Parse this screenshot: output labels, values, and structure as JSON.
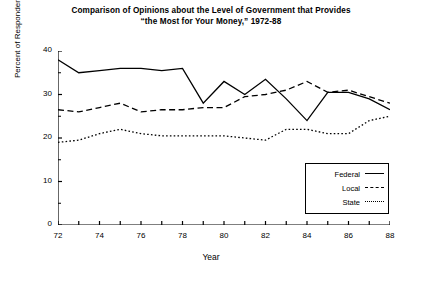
{
  "chart_data": {
    "type": "line",
    "title": "Comparison of Opinions about the Level of Government that Provides “the Most for Your Money,” 1972-88",
    "title_line1": "Comparison of Opinions about the Level of Government that Provides",
    "title_line2": "“the Most for Your Money,” 1972-88",
    "xlabel": "Year",
    "ylabel": "Percent of Respondents",
    "xlim": [
      72,
      88
    ],
    "ylim": [
      0,
      40
    ],
    "grid": false,
    "legend_position": "lower-right",
    "y_ticks": [
      0,
      10,
      20,
      30,
      40
    ],
    "y_tick_labels": [
      "0",
      "10",
      "20",
      "30",
      "40"
    ],
    "y_minor_ticks": [
      5,
      15,
      25,
      35
    ],
    "x_ticks": [
      72,
      73,
      74,
      75,
      76,
      77,
      78,
      79,
      80,
      81,
      82,
      83,
      84,
      85,
      86,
      87,
      88
    ],
    "x_tick_labels": [
      {
        "value": 72,
        "label": "72"
      },
      {
        "value": 74,
        "label": "74"
      },
      {
        "value": 76,
        "label": "76"
      },
      {
        "value": 78,
        "label": "78"
      },
      {
        "value": 80,
        "label": "80"
      },
      {
        "value": 82,
        "label": "82"
      },
      {
        "value": 84,
        "label": "84"
      },
      {
        "value": 86,
        "label": "86"
      },
      {
        "value": 88,
        "label": "88"
      }
    ],
    "x": [
      72,
      73,
      74,
      75,
      76,
      77,
      78,
      79,
      80,
      81,
      82,
      83,
      84,
      85,
      86,
      87,
      88
    ],
    "series": [
      {
        "name": "Federal",
        "style": "solid",
        "color": "#000000",
        "values": [
          38,
          35,
          35.5,
          36,
          36,
          35.5,
          36,
          28,
          33,
          30,
          33.5,
          29,
          24,
          30.5,
          30.5,
          29,
          26.5
        ]
      },
      {
        "name": "Local",
        "style": "dashed",
        "color": "#000000",
        "values": [
          26.5,
          26,
          27,
          28,
          26,
          26.5,
          26.5,
          27,
          27,
          29.5,
          30,
          31,
          33,
          30.5,
          31,
          29.5,
          28
        ]
      },
      {
        "name": "State",
        "style": "dotted",
        "color": "#000000",
        "values": [
          19,
          19.5,
          21,
          22,
          21,
          20.5,
          20.5,
          20.5,
          20.5,
          20,
          19.5,
          22,
          22,
          21,
          21,
          24,
          25
        ]
      }
    ]
  },
  "legend": {
    "entries": [
      {
        "label": "Federal",
        "style": "solid"
      },
      {
        "label": "Local",
        "style": "dashed"
      },
      {
        "label": "State",
        "style": "dotted"
      }
    ]
  }
}
